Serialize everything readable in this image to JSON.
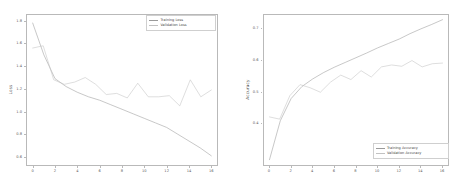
{
  "figure": {
    "background": "#ffffff",
    "width": 461,
    "height": 184
  },
  "chart_data": [
    {
      "type": "line",
      "id": "loss-chart",
      "title": "",
      "xlabel": "",
      "ylabel": "Loss",
      "xlim": [
        -0.6,
        16.6
      ],
      "ylim": [
        0.52,
        1.86
      ],
      "xticks": [
        0,
        2,
        4,
        6,
        8,
        10,
        12,
        14,
        16
      ],
      "xtick_labels": [
        "0",
        "2",
        "4",
        "6",
        "8",
        "10",
        "12",
        "14",
        "16"
      ],
      "yticks": [
        0.6,
        0.8,
        1.0,
        1.2,
        1.4,
        1.6,
        1.8
      ],
      "ytick_labels": [
        "0.6",
        "0.8",
        "1.0",
        "1.2",
        "1.4",
        "1.6",
        "1.8"
      ],
      "grid": false,
      "legend_position": "upper right",
      "x": [
        0,
        1,
        2,
        3,
        4,
        5,
        6,
        7,
        8,
        9,
        10,
        11,
        12,
        13,
        14,
        15,
        16
      ],
      "series": [
        {
          "name": "Training Loss",
          "color": "#9a9a9a",
          "values": [
            1.78,
            1.5,
            1.29,
            1.22,
            1.17,
            1.13,
            1.1,
            1.06,
            1.02,
            0.98,
            0.94,
            0.9,
            0.86,
            0.8,
            0.74,
            0.68,
            0.61
          ]
        },
        {
          "name": "Validation Loss",
          "color": "#c2c2c2",
          "values": [
            1.56,
            1.58,
            1.28,
            1.24,
            1.26,
            1.3,
            1.24,
            1.15,
            1.16,
            1.12,
            1.25,
            1.13,
            1.13,
            1.14,
            1.05,
            1.28,
            1.13,
            1.19
          ]
        }
      ]
    },
    {
      "type": "line",
      "id": "accuracy-chart",
      "title": "",
      "xlabel": "",
      "ylabel": "Accuracy",
      "xlim": [
        -0.6,
        16.6
      ],
      "ylim": [
        0.265,
        0.745
      ],
      "xticks": [
        0,
        2,
        4,
        6,
        8,
        10,
        12,
        14,
        16
      ],
      "xtick_labels": [
        "0",
        "2",
        "4",
        "6",
        "8",
        "10",
        "12",
        "14",
        "16"
      ],
      "yticks": [
        0.4,
        0.5,
        0.6,
        0.7
      ],
      "ytick_labels": [
        "0.4",
        "0.5",
        "0.6",
        "0.7"
      ],
      "grid": false,
      "legend_position": "lower right",
      "x": [
        0,
        1,
        2,
        3,
        4,
        5,
        6,
        7,
        8,
        9,
        10,
        11,
        12,
        13,
        14,
        15,
        16
      ],
      "series": [
        {
          "name": "Training Accuracy",
          "color": "#9a9a9a",
          "values": [
            0.285,
            0.408,
            0.478,
            0.516,
            0.54,
            0.56,
            0.577,
            0.592,
            0.607,
            0.622,
            0.638,
            0.652,
            0.666,
            0.683,
            0.698,
            0.712,
            0.727
          ]
        },
        {
          "name": "Validation Accuracy",
          "color": "#c2c2c2",
          "values": [
            0.42,
            0.413,
            0.487,
            0.522,
            0.512,
            0.498,
            0.53,
            0.552,
            0.538,
            0.566,
            0.546,
            0.578,
            0.584,
            0.58,
            0.598,
            0.578,
            0.588,
            0.59
          ]
        }
      ]
    }
  ]
}
